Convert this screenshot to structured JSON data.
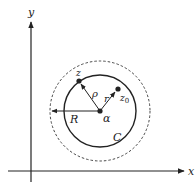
{
  "figure": {
    "axes": {
      "x_label": "x",
      "y_label": "y"
    },
    "labels": {
      "z": "z",
      "z0": "z",
      "z0_sub": "0",
      "rho": "ρ",
      "r": "r",
      "R": "R",
      "alpha": "α",
      "C": "C"
    },
    "colors": {
      "ink": "#222222",
      "background": "#ffffff"
    },
    "geometry": {
      "center": [
        100,
        111
      ],
      "contour_C_radius": 36,
      "dashed_circle_radius": 50,
      "point_z": [
        79,
        81
      ],
      "point_z0": [
        118,
        89
      ]
    }
  }
}
